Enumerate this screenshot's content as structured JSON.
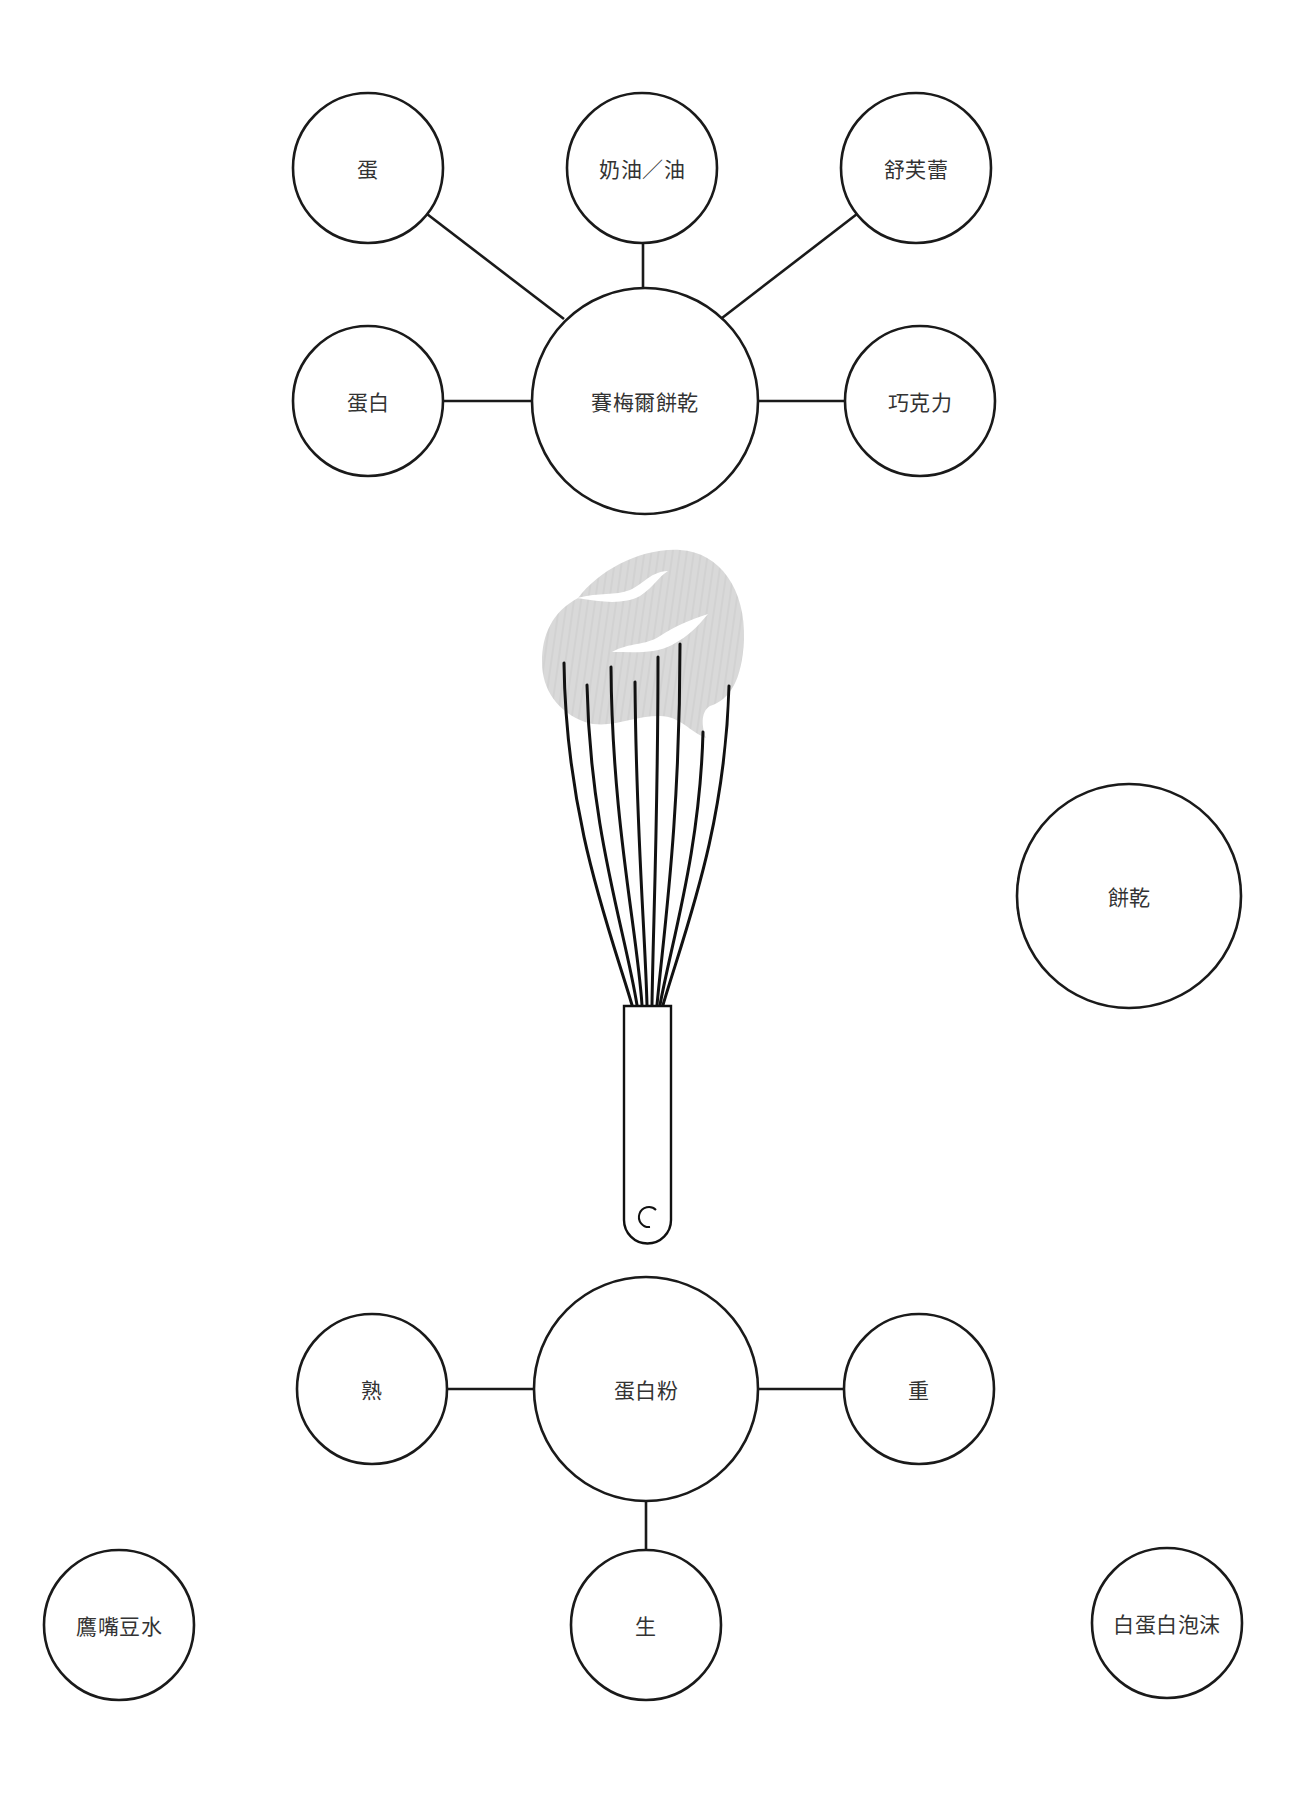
{
  "diagram": {
    "top_cluster": {
      "center": {
        "label": "賽梅爾餅乾",
        "cx": 645,
        "cy": 401,
        "r": 113
      },
      "satellites": [
        {
          "label": "蛋",
          "cx": 368,
          "cy": 168,
          "r": 75
        },
        {
          "label": "奶油／油",
          "cx": 642,
          "cy": 168,
          "r": 75
        },
        {
          "label": "舒芙蕾",
          "cx": 916,
          "cy": 168,
          "r": 75
        },
        {
          "label": "蛋白",
          "cx": 368,
          "cy": 401,
          "r": 75
        },
        {
          "label": "巧克力",
          "cx": 920,
          "cy": 401,
          "r": 75
        }
      ]
    },
    "standalone": {
      "label": "餅乾",
      "cx": 1129,
      "cy": 896,
      "r": 112
    },
    "illustration": {
      "name": "whisk-with-foam"
    },
    "bottom_cluster": {
      "center": {
        "label": "蛋白粉",
        "cx": 646,
        "cy": 1389,
        "r": 112
      },
      "satellites": [
        {
          "label": "熟",
          "cx": 372,
          "cy": 1389,
          "r": 75
        },
        {
          "label": "重",
          "cx": 919,
          "cy": 1389,
          "r": 75
        },
        {
          "label": "生",
          "cx": 646,
          "cy": 1625,
          "r": 75
        }
      ]
    },
    "bottom_corners": [
      {
        "label": "鷹嘴豆水",
        "cx": 119,
        "cy": 1625,
        "r": 75
      },
      {
        "label": "白蛋白泡沫",
        "cx": 1167,
        "cy": 1623,
        "r": 75
      }
    ]
  },
  "colors": {
    "stroke": "#1a1a1a",
    "text": "#333333",
    "foam": "#d9d9d9",
    "background": "#ffffff"
  }
}
